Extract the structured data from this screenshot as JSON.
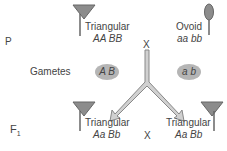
{
  "generations": {
    "p_label": "P",
    "gametes_label": "Gametes",
    "f1_label_main": "F",
    "f1_label_sub": "1"
  },
  "parents": [
    {
      "phenotype": "Triangular",
      "genotype": "AA BB",
      "shape": "triangular-pod-icon"
    },
    {
      "phenotype": "Ovoid",
      "genotype": "aa bb",
      "shape": "ovoid-pod-icon"
    }
  ],
  "cross_symbol": "X",
  "gametes": [
    {
      "alleles": "A B"
    },
    {
      "alleles": "a b"
    }
  ],
  "f1": [
    {
      "phenotype": "Triangular",
      "genotype": "Aa Bb"
    },
    {
      "phenotype": "Triangular",
      "genotype": "Aa Bb"
    }
  ],
  "colors": {
    "shape_fill": "#8c8c8c",
    "stem": "#666666",
    "gamete_fill": "#b5b5b5",
    "arrow_fill": "#d0d0d0",
    "arrow_stroke": "#888888",
    "text": "#444444"
  }
}
